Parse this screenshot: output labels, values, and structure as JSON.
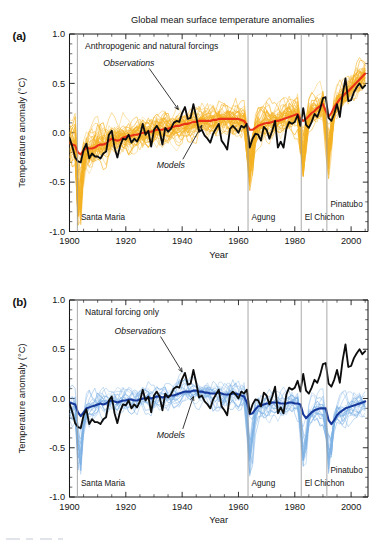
{
  "figure": {
    "title": "Global mean surface temperature anomalies",
    "xlabel": "Year",
    "ylabel": "Temperature anomaly (°C)"
  },
  "panels": [
    {
      "id": "a",
      "label": "(a)",
      "caption": "Anthropogenic and natural forcings",
      "obs_label": "Observations",
      "models_label": "Models",
      "ensemble_color": "#F5B325",
      "ensemble_mean_color": "#E83117",
      "observation_color": "#0D0D0D"
    },
    {
      "id": "b",
      "label": "(b)",
      "caption": "Natural forcing only",
      "obs_label": "Observations",
      "models_label": "Models",
      "ensemble_color": "#7FB2E5",
      "ensemble_mean_color": "#16389B",
      "observation_color": "#0D0D0D"
    }
  ],
  "volcanoes": [
    {
      "name": "Santa Maria",
      "year": 1902.8
    },
    {
      "name": "Agung",
      "year": 1963.4
    },
    {
      "name": "El Chichon",
      "year": 1982.3
    },
    {
      "name": "Pinatubo",
      "year": 1991.4
    }
  ],
  "chart_data": {
    "type": "line",
    "title": "Global mean surface temperature anomalies",
    "xlabel": "Year",
    "ylabel": "Temperature anomaly (°C)",
    "xlim": [
      1900,
      2006
    ],
    "ylim": [
      -1.0,
      1.0
    ],
    "xticks": [
      1900,
      1920,
      1940,
      1960,
      1980,
      2000
    ],
    "xticklabels": [
      "1900",
      "1920",
      "1940",
      "1960",
      "1980",
      "2000"
    ],
    "xminor_step": 5,
    "yticks": [
      -1.0,
      -0.5,
      0.0,
      0.5,
      1.0
    ],
    "yticklabels": [
      "-1.0",
      "-0.5",
      "0.0",
      "0.5",
      "1.0"
    ],
    "yminor_step": 0.1,
    "grid": false,
    "legend": "annotations",
    "x": [
      1900,
      1901,
      1902,
      1903,
      1904,
      1905,
      1906,
      1907,
      1908,
      1909,
      1910,
      1911,
      1912,
      1913,
      1914,
      1915,
      1916,
      1917,
      1918,
      1919,
      1920,
      1921,
      1922,
      1923,
      1924,
      1925,
      1926,
      1927,
      1928,
      1929,
      1930,
      1931,
      1932,
      1933,
      1934,
      1935,
      1936,
      1937,
      1938,
      1939,
      1940,
      1941,
      1942,
      1943,
      1944,
      1945,
      1946,
      1947,
      1948,
      1949,
      1950,
      1951,
      1952,
      1953,
      1954,
      1955,
      1956,
      1957,
      1958,
      1959,
      1960,
      1961,
      1962,
      1963,
      1964,
      1965,
      1966,
      1967,
      1968,
      1969,
      1970,
      1971,
      1972,
      1973,
      1974,
      1975,
      1976,
      1977,
      1978,
      1979,
      1980,
      1981,
      1982,
      1983,
      1984,
      1985,
      1986,
      1987,
      1988,
      1989,
      1990,
      1991,
      1992,
      1993,
      1994,
      1995,
      1996,
      1997,
      1998,
      1999,
      2000,
      2001,
      2002,
      2003,
      2004,
      2005
    ],
    "series": [
      {
        "name": "Observations",
        "panel": "a",
        "color": "#0D0D0D",
        "values": [
          -0.05,
          -0.14,
          -0.25,
          -0.29,
          -0.3,
          -0.17,
          -0.11,
          -0.26,
          -0.21,
          -0.24,
          -0.24,
          -0.26,
          -0.21,
          -0.19,
          -0.02,
          0.02,
          -0.15,
          -0.25,
          -0.13,
          -0.06,
          -0.07,
          -0.02,
          -0.1,
          -0.06,
          -0.09,
          -0.03,
          0.09,
          -0.02,
          0.02,
          -0.14,
          0.03,
          0.07,
          0.02,
          -0.12,
          0.05,
          0.01,
          0.04,
          0.1,
          0.12,
          0.11,
          0.2,
          0.26,
          0.14,
          0.15,
          0.29,
          0.16,
          0.01,
          0.03,
          -0.03,
          -0.06,
          -0.1,
          -0.01,
          0.04,
          0.09,
          -0.08,
          -0.12,
          -0.17,
          0.04,
          0.07,
          0.04,
          0.0,
          0.07,
          0.05,
          0.09,
          -0.15,
          -0.06,
          -0.01,
          -0.02,
          -0.08,
          0.06,
          0.03,
          -0.06,
          0.02,
          0.12,
          -0.15,
          -0.09,
          -0.15,
          0.04,
          0.11,
          0.09,
          0.11,
          0.18,
          0.07,
          0.25,
          0.08,
          0.05,
          0.11,
          0.19,
          0.16,
          0.24,
          0.35,
          0.36,
          0.15,
          0.12,
          0.19,
          0.29,
          0.16,
          0.39,
          0.55,
          0.32,
          0.33,
          0.41,
          0.46,
          0.5,
          0.45,
          0.48
        ]
      },
      {
        "name": "Models (ensemble mean, anthropogenic + natural)",
        "panel": "a",
        "color": "#E83117",
        "values": [
          -0.1,
          -0.12,
          -0.13,
          -0.2,
          -0.22,
          -0.18,
          -0.15,
          -0.16,
          -0.16,
          -0.15,
          -0.13,
          -0.12,
          -0.12,
          -0.11,
          -0.08,
          -0.06,
          -0.07,
          -0.08,
          -0.07,
          -0.05,
          -0.04,
          -0.03,
          -0.03,
          -0.02,
          -0.02,
          -0.01,
          0.0,
          0.0,
          0.01,
          0.01,
          0.02,
          0.03,
          0.03,
          0.03,
          0.04,
          0.04,
          0.05,
          0.06,
          0.07,
          0.07,
          0.08,
          0.09,
          0.09,
          0.1,
          0.11,
          0.11,
          0.12,
          0.12,
          0.12,
          0.12,
          0.12,
          0.13,
          0.13,
          0.14,
          0.14,
          0.14,
          0.14,
          0.14,
          0.14,
          0.14,
          0.14,
          0.13,
          0.12,
          0.08,
          0.03,
          0.03,
          0.05,
          0.07,
          0.08,
          0.09,
          0.1,
          0.1,
          0.11,
          0.12,
          0.12,
          0.13,
          0.14,
          0.15,
          0.16,
          0.17,
          0.18,
          0.19,
          0.14,
          0.12,
          0.14,
          0.17,
          0.2,
          0.22,
          0.25,
          0.27,
          0.29,
          0.22,
          0.16,
          0.2,
          0.26,
          0.3,
          0.34,
          0.37,
          0.4,
          0.42,
          0.45,
          0.48,
          0.51,
          0.54,
          0.57,
          0.6
        ]
      },
      {
        "name": "Observations",
        "panel": "b",
        "color": "#0D0D0D",
        "values": [
          -0.05,
          -0.14,
          -0.25,
          -0.29,
          -0.3,
          -0.17,
          -0.11,
          -0.26,
          -0.21,
          -0.24,
          -0.24,
          -0.26,
          -0.21,
          -0.19,
          -0.02,
          0.02,
          -0.15,
          -0.25,
          -0.13,
          -0.06,
          -0.07,
          -0.02,
          -0.1,
          -0.06,
          -0.09,
          -0.03,
          0.09,
          -0.02,
          0.02,
          -0.14,
          0.03,
          0.07,
          0.02,
          -0.12,
          0.05,
          0.01,
          0.04,
          0.1,
          0.12,
          0.11,
          0.2,
          0.26,
          0.14,
          0.15,
          0.29,
          0.16,
          0.01,
          0.03,
          -0.03,
          -0.06,
          -0.1,
          -0.01,
          0.04,
          0.09,
          -0.08,
          -0.12,
          -0.17,
          0.04,
          0.07,
          0.04,
          0.0,
          0.07,
          0.05,
          0.09,
          -0.15,
          -0.06,
          -0.01,
          -0.02,
          -0.08,
          0.06,
          0.03,
          -0.06,
          0.02,
          0.12,
          -0.15,
          -0.09,
          -0.15,
          0.04,
          0.11,
          0.09,
          0.11,
          0.18,
          0.07,
          0.25,
          0.08,
          0.05,
          0.11,
          0.19,
          0.16,
          0.24,
          0.35,
          0.36,
          0.15,
          0.12,
          0.19,
          0.29,
          0.16,
          0.39,
          0.55,
          0.32,
          0.33,
          0.41,
          0.46,
          0.5,
          0.45,
          0.48
        ]
      },
      {
        "name": "Models (ensemble mean, natural only)",
        "panel": "b",
        "color": "#16389B",
        "values": [
          -0.04,
          -0.05,
          -0.06,
          -0.14,
          -0.18,
          -0.14,
          -0.1,
          -0.09,
          -0.08,
          -0.07,
          -0.06,
          -0.05,
          -0.06,
          -0.05,
          -0.03,
          -0.02,
          -0.03,
          -0.04,
          -0.03,
          -0.02,
          -0.02,
          -0.01,
          -0.01,
          -0.02,
          -0.02,
          -0.01,
          0.0,
          0.0,
          0.01,
          0.0,
          0.01,
          0.02,
          0.02,
          0.01,
          0.02,
          0.02,
          0.03,
          0.03,
          0.04,
          0.05,
          0.06,
          0.07,
          0.07,
          0.07,
          0.08,
          0.08,
          0.07,
          0.07,
          0.06,
          0.06,
          0.05,
          0.05,
          0.05,
          0.06,
          0.05,
          0.04,
          0.04,
          0.04,
          0.05,
          0.05,
          0.04,
          0.03,
          0.02,
          -0.04,
          -0.16,
          -0.15,
          -0.11,
          -0.08,
          -0.07,
          -0.06,
          -0.05,
          -0.05,
          -0.04,
          -0.04,
          -0.04,
          -0.05,
          -0.05,
          -0.05,
          -0.04,
          -0.04,
          -0.05,
          -0.05,
          -0.06,
          -0.16,
          -0.2,
          -0.17,
          -0.14,
          -0.12,
          -0.11,
          -0.1,
          -0.1,
          -0.1,
          -0.22,
          -0.26,
          -0.22,
          -0.17,
          -0.14,
          -0.12,
          -0.1,
          -0.09,
          -0.08,
          -0.07,
          -0.06,
          -0.05,
          -0.04,
          -0.03
        ]
      }
    ],
    "ensemble_spread": {
      "a": {
        "n_members": 44,
        "color": "#F5B325",
        "band_half_width": [
          0.26,
          0.22,
          0.19,
          0.17,
          0.16,
          0.15,
          0.15,
          0.15,
          0.15,
          0.15,
          0.15,
          0.16,
          0.16,
          0.16,
          0.17,
          0.17,
          0.16,
          0.16,
          0.16,
          0.16,
          0.16,
          0.16,
          0.16,
          0.16
        ]
      },
      "b": {
        "n_members": 19,
        "color": "#7FB2E5",
        "band_half_width": [
          0.22,
          0.18,
          0.16,
          0.15,
          0.14,
          0.14,
          0.14,
          0.14,
          0.14,
          0.14,
          0.14,
          0.15,
          0.16,
          0.16,
          0.17,
          0.17,
          0.16,
          0.16,
          0.16,
          0.16,
          0.16,
          0.16,
          0.16,
          0.16
        ]
      }
    }
  }
}
